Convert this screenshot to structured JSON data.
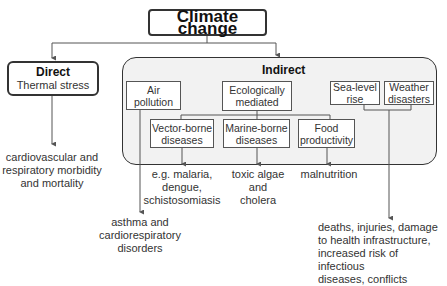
{
  "root": {
    "label": "Climate change"
  },
  "direct": {
    "title": "Direct",
    "subtitle": "Thermal stress",
    "outcome": [
      "cardiovascular and",
      "respiratory morbidity",
      "and mortality"
    ]
  },
  "indirect": {
    "title": "Indirect",
    "pathways": {
      "air_pollution": {
        "label": [
          "Air",
          "pollution"
        ]
      },
      "ecologically_mediated": {
        "label": [
          "Ecologically",
          "mediated"
        ]
      },
      "sea_level_rise": {
        "label": [
          "Sea-level",
          "rise"
        ]
      },
      "weather_disasters": {
        "label": [
          "Weather",
          "disasters"
        ]
      },
      "vector_borne": {
        "label": [
          "Vector-borne",
          "diseases"
        ]
      },
      "marine_borne": {
        "label": [
          "Marine-borne",
          "diseases"
        ]
      },
      "food_productivity": {
        "label": [
          "Food",
          "productivity"
        ]
      }
    },
    "outcomes": {
      "vector_borne": [
        "e.g. malaria,",
        "dengue,",
        "schistosomiasis"
      ],
      "marine_borne": [
        "toxic algae",
        "and",
        "cholera"
      ],
      "food_productivity": [
        "malnutrition"
      ],
      "air_pollution": [
        "asthma and",
        "cardiorespiratory",
        "disorders"
      ],
      "sea_weather": [
        "deaths, injuries, damage",
        "to health infrastructure,",
        "increased risk of infectious",
        "diseases, conflicts"
      ]
    }
  },
  "colors": {
    "line": "#555555",
    "panel_bg": "#f2f2f2",
    "border": "#333333",
    "text": "#333333"
  }
}
